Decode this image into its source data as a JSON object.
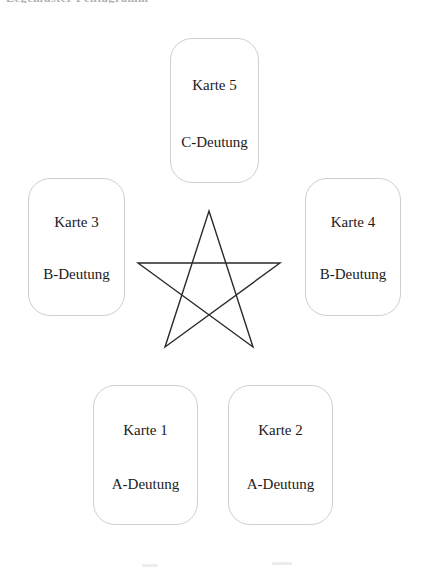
{
  "page": {
    "top_fragment_text": "Legemuster Pentagramm",
    "background_color": "#ffffff",
    "ink_color": "#1b1b1b",
    "border_color": "#cfcfcf"
  },
  "cards": [
    {
      "id": "card-5",
      "position": "top",
      "title": "Karte 5",
      "meaning": "C-Deutung"
    },
    {
      "id": "card-3",
      "position": "left",
      "title": "Karte 3",
      "meaning": "B-Deutung"
    },
    {
      "id": "card-4",
      "position": "right",
      "title": "Karte 4",
      "meaning": "B-Deutung"
    },
    {
      "id": "card-1",
      "position": "bottom-left",
      "title": "Karte 1",
      "meaning": "A-Deutung"
    },
    {
      "id": "card-2",
      "position": "bottom-right",
      "title": "Karte 2",
      "meaning": "A-Deutung"
    }
  ],
  "pentagram": {
    "shape": "five-pointed-star-unicursal",
    "stroke_color": "#2a2a2a",
    "stroke_width": 1.4,
    "center_x": 209,
    "center_y": 286,
    "radius": 75,
    "vertices": [
      {
        "name": "apex-top",
        "x": 209,
        "y": 211
      },
      {
        "name": "arm-right",
        "x": 280,
        "y": 263
      },
      {
        "name": "leg-bottom-right",
        "x": 253,
        "y": 347
      },
      {
        "name": "leg-bottom-left",
        "x": 165,
        "y": 347
      },
      {
        "name": "arm-left",
        "x": 138,
        "y": 263
      }
    ],
    "draw_order": [
      0,
      2,
      4,
      1,
      3
    ]
  },
  "scan_marks": [
    {
      "id": "scan-mark-a"
    },
    {
      "id": "scan-mark-b"
    }
  ]
}
